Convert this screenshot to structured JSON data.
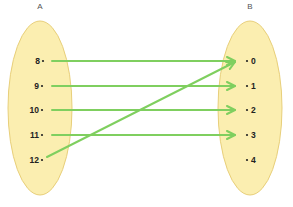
{
  "diagram": {
    "type": "function-mapping",
    "colors": {
      "ellipse_fill": "#fbeeb0",
      "ellipse_stroke": "#e8cf7a",
      "arrow": "#7fcf5f",
      "text": "#222222"
    },
    "set_a": {
      "label": "A",
      "elements": [
        "8",
        "9",
        "10",
        "11",
        "12"
      ]
    },
    "set_b": {
      "label": "B",
      "elements": [
        "0",
        "1",
        "2",
        "3",
        "4"
      ]
    },
    "mappings": [
      {
        "from": "8",
        "to": "0"
      },
      {
        "from": "9",
        "to": "1"
      },
      {
        "from": "10",
        "to": "2"
      },
      {
        "from": "11",
        "to": "3"
      },
      {
        "from": "12",
        "to": "0"
      }
    ]
  }
}
